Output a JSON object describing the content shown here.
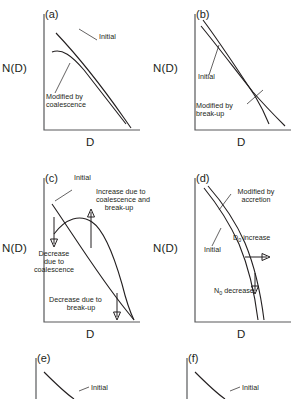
{
  "figure": {
    "axis_y_label": "N(D)",
    "axis_x_label": "D",
    "line_color": "#231f20",
    "axis_color": "#58595b",
    "background": "#ffffff"
  },
  "panels": [
    {
      "tag": "(a)",
      "y_label": "N(D)",
      "x_label": "D",
      "annotations": [
        {
          "name": "initial-label",
          "text": "Initial"
        },
        {
          "name": "modified-label-line1",
          "text": "Modified by"
        },
        {
          "name": "modified-label-line2",
          "text": "coalescence"
        }
      ]
    },
    {
      "tag": "(b)",
      "y_label": "N(D)",
      "x_label": "D",
      "annotations": [
        {
          "name": "initial-label",
          "text": "Initial"
        },
        {
          "name": "modified-label-line1",
          "text": "Modified by"
        },
        {
          "name": "modified-label-line2",
          "text": "break-up"
        }
      ]
    },
    {
      "tag": "(c)",
      "y_label": "N(D)",
      "x_label": "D",
      "annotations": [
        {
          "name": "initial-label",
          "text": "Initial"
        },
        {
          "name": "increase-label-line1",
          "text": "Increase due to"
        },
        {
          "name": "increase-label-line2",
          "text": "coalescence and"
        },
        {
          "name": "increase-label-line3",
          "text": "break-up"
        },
        {
          "name": "decrease-coalescence-line1",
          "text": "Decrease"
        },
        {
          "name": "decrease-coalescence-line2",
          "text": "due to"
        },
        {
          "name": "decrease-coalescence-line3",
          "text": "coalescence"
        },
        {
          "name": "decrease-breakup-line1",
          "text": "Decrease due to"
        },
        {
          "name": "decrease-breakup-line2",
          "text": "break-up"
        }
      ]
    },
    {
      "tag": "(d)",
      "y_label": "N(D)",
      "x_label": "D",
      "annotations": [
        {
          "name": "modified-accretion-line1",
          "text": "Modified by"
        },
        {
          "name": "modified-accretion-line2",
          "text": "accretion"
        },
        {
          "name": "initial-label",
          "text": "Initial"
        },
        {
          "name": "d0-increase-symbol",
          "text": "D"
        },
        {
          "name": "d0-increase-subscript",
          "text": "0"
        },
        {
          "name": "d0-increase-text",
          "text": " increase"
        },
        {
          "name": "n0-decrease-symbol",
          "text": "N"
        },
        {
          "name": "n0-decrease-subscript",
          "text": "0"
        },
        {
          "name": "n0-decrease-text",
          "text": " decrease"
        }
      ]
    },
    {
      "tag": "(e)",
      "annotations": [
        {
          "name": "initial-label",
          "text": "Initial"
        }
      ]
    },
    {
      "tag": "(f)",
      "annotations": [
        {
          "name": "initial-label",
          "text": "Initial"
        }
      ]
    }
  ]
}
